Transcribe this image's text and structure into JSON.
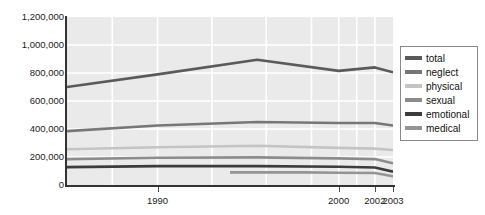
{
  "chart_data": {
    "type": "line",
    "title": "",
    "xlabel": "",
    "ylabel": "",
    "xlim": [
      1985,
      2003
    ],
    "ylim": [
      0,
      1200000
    ],
    "grid": true,
    "legend_position": "right",
    "y_ticks": [
      {
        "value": 1200000,
        "label": "1,200,000"
      },
      {
        "value": 1000000,
        "label": "1,000,000"
      },
      {
        "value": 800000,
        "label": "800,000"
      },
      {
        "value": 600000,
        "label": "600,000"
      },
      {
        "value": 400000,
        "label": "400,000"
      },
      {
        "value": 200000,
        "label": "200,000"
      },
      {
        "value": 0,
        "label": "0"
      }
    ],
    "x_ticks": [
      {
        "value": 1990,
        "label": "1990"
      },
      {
        "value": 2000,
        "label": "2000"
      },
      {
        "value": 2002,
        "label": "2002"
      },
      {
        "value": 2003,
        "label": "2003"
      }
    ],
    "series": [
      {
        "name": "total",
        "color": "#5a5a5a",
        "x": [
          1985,
          1990,
          1995.5,
          2000,
          2002,
          2003
        ],
        "values": [
          700000,
          790000,
          895000,
          815000,
          840000,
          805000
        ]
      },
      {
        "name": "neglect",
        "color": "#777777",
        "x": [
          1985,
          1990,
          1995.5,
          2000,
          2002,
          2003
        ],
        "values": [
          385000,
          425000,
          450000,
          443000,
          443000,
          425000
        ]
      },
      {
        "name": "physical",
        "color": "#c4c4c4",
        "x": [
          1985,
          1990,
          1995.5,
          2000,
          2002,
          2003
        ],
        "values": [
          255000,
          270000,
          280000,
          265000,
          260000,
          250000
        ]
      },
      {
        "name": "sexual",
        "color": "#8c8c8c",
        "x": [
          1985,
          1990,
          1995.5,
          2000,
          2002,
          2003
        ],
        "values": [
          185000,
          195000,
          197000,
          190000,
          185000,
          155000
        ]
      },
      {
        "name": "emotional",
        "color": "#3c3c3c",
        "x": [
          1985,
          1990,
          1995.5,
          2000,
          2002,
          2003
        ],
        "values": [
          128000,
          135000,
          135000,
          130000,
          125000,
          95000
        ]
      },
      {
        "name": "medical",
        "color": "#949494",
        "x": [
          1994,
          1998,
          2000,
          2002,
          2003
        ],
        "values": [
          90000,
          90000,
          88000,
          86000,
          62000
        ]
      }
    ]
  },
  "legend": {
    "items": [
      {
        "label": "total",
        "color": "#5a5a5a"
      },
      {
        "label": "neglect",
        "color": "#777777"
      },
      {
        "label": "physical",
        "color": "#c4c4c4"
      },
      {
        "label": "sexual",
        "color": "#8c8c8c"
      },
      {
        "label": "emotional",
        "color": "#3c3c3c"
      },
      {
        "label": "medical",
        "color": "#949494"
      }
    ]
  },
  "axes": {
    "y_tick_labels": [
      "1,200,000",
      "1,000,000",
      "800,000",
      "600,000",
      "400,000",
      "200,000",
      "0"
    ],
    "x_tick_labels": [
      "1990",
      "2000",
      "2002",
      "2003"
    ]
  },
  "style": {
    "plot_background": "#eaeaea",
    "gridline_color": "#ffffff",
    "axis_color": "#333333",
    "legend_border": "#8a8a8a",
    "legend_background": "#ffffff",
    "page_background": "#ffffff"
  }
}
